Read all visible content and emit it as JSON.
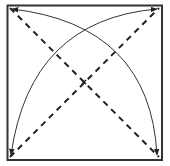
{
  "diagram": {
    "colors": {
      "stroke": "#333333",
      "background": "#ffffff"
    },
    "square": {
      "x": 7,
      "y": 5,
      "width": 155,
      "height": 155
    },
    "center_mark": {
      "x": 84,
      "y": 82
    },
    "dashed_lines": [
      {
        "name": "diagonal-tl-br",
        "from": [
          7,
          5
        ],
        "to": [
          162,
          160
        ]
      },
      {
        "name": "diagonal-bl-tr",
        "from": [
          7,
          160
        ],
        "to": [
          162,
          5
        ]
      }
    ],
    "curved_arrows": [
      {
        "name": "arc-tl-to-br",
        "from": "top-left",
        "to": "bottom-right",
        "arrowheads": "both"
      },
      {
        "name": "arc-bl-to-tr",
        "from": "bottom-left",
        "to": "top-right",
        "arrowheads": "both"
      }
    ]
  }
}
